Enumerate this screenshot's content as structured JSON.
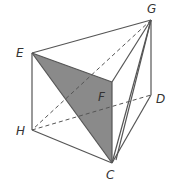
{
  "figure": {
    "type": "prism",
    "colors": {
      "edge": "#555555",
      "shade": "#8a8a8a",
      "label": "#333333"
    },
    "vertices": {
      "G": {
        "label": "G",
        "x": 151,
        "y": 20,
        "lx": 147,
        "ly": 13
      },
      "E": {
        "label": "E",
        "x": 32,
        "y": 53,
        "lx": 16,
        "ly": 57
      },
      "F": {
        "label": "F",
        "x": 112,
        "y": 82,
        "lx": 98,
        "ly": 101
      },
      "D": {
        "label": "D",
        "x": 151,
        "y": 95,
        "lx": 156,
        "ly": 103
      },
      "H": {
        "label": "H",
        "x": 32,
        "y": 130,
        "lx": 16,
        "ly": 135
      },
      "C": {
        "label": "C",
        "x": 112,
        "y": 163,
        "lx": 106,
        "ly": 179
      }
    },
    "shaded_face": [
      "E",
      "F",
      "C"
    ],
    "solid_edges": [
      [
        "E",
        "G"
      ],
      [
        "E",
        "F"
      ],
      [
        "F",
        "G"
      ],
      [
        "E",
        "H"
      ],
      [
        "H",
        "C"
      ],
      [
        "F",
        "C"
      ],
      [
        "G",
        "D"
      ],
      [
        "D",
        "C"
      ],
      [
        "G",
        "C"
      ],
      [
        "E",
        "C"
      ]
    ],
    "dashed_edges": [
      [
        "G",
        "H"
      ],
      [
        "H",
        "D"
      ]
    ]
  }
}
